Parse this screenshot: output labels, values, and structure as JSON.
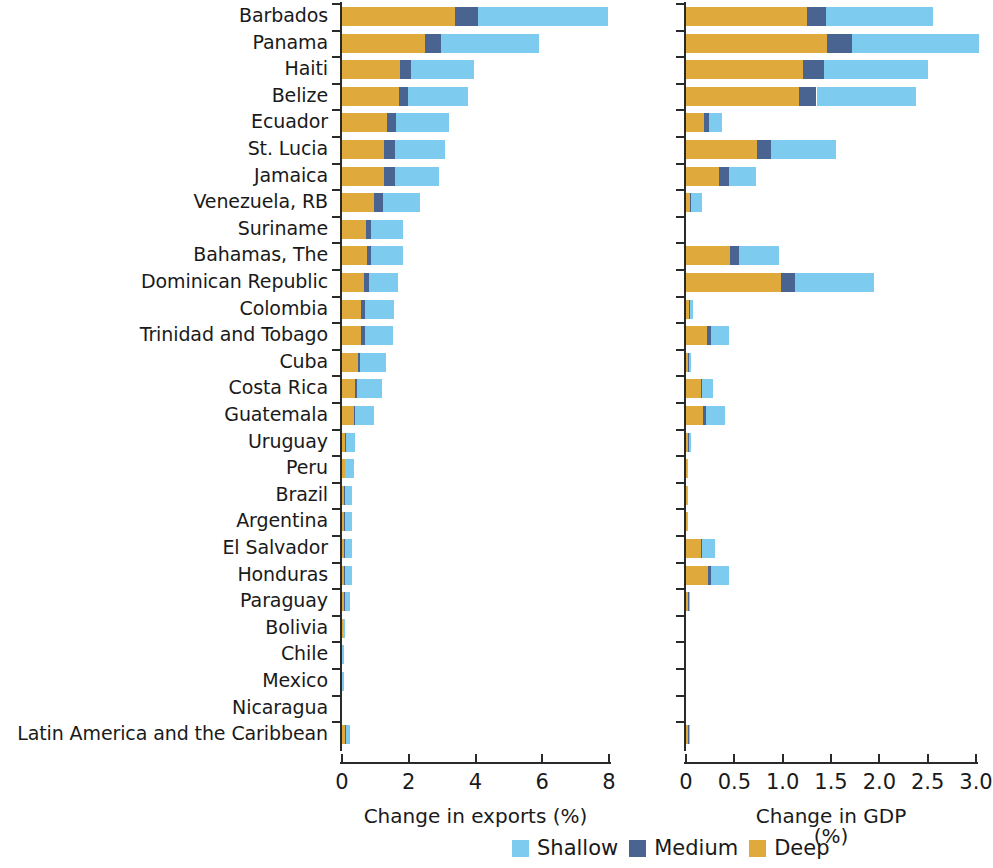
{
  "figure": {
    "legend": {
      "items": [
        {
          "label": "Shallow",
          "color": "#7dcbef",
          "key": "shallow"
        },
        {
          "label": "Medium",
          "color": "#4a6491",
          "key": "medium"
        },
        {
          "label": "Deep",
          "color": "#e0a93b",
          "key": "deep"
        }
      ]
    }
  },
  "chart_data": [
    {
      "type": "bar",
      "orientation": "horizontal",
      "stacked": true,
      "panel": "left",
      "title": "",
      "xlabel": "Change in exports (%)",
      "ylabel": "",
      "xlim": [
        0,
        8
      ],
      "xticks": [
        0,
        2,
        4,
        6,
        8
      ],
      "xticklabels": [
        "0",
        "2",
        "4",
        "6",
        "8"
      ],
      "grid": false,
      "legend_position": "bottom-right",
      "categories": [
        "Barbados",
        "Panama",
        "Haiti",
        "Belize",
        "Ecuador",
        "St. Lucia",
        "Jamaica",
        "Venezuela, RB",
        "Suriname",
        "Bahamas, The",
        "Dominican Republic",
        "Colombia",
        "Trinidad and Tobago",
        "Cuba",
        "Costa Rica",
        "Guatemala",
        "Uruguay",
        "Peru",
        "Brazil",
        "Argentina",
        "El Salvador",
        "Honduras",
        "Paraguay",
        "Bolivia",
        "Chile",
        "Mexico",
        "Nicaragua",
        "Latin America and the Caribbean"
      ],
      "series": [
        {
          "name": "Deep",
          "color": "#e0a93b",
          "values": [
            3.39,
            2.5,
            1.74,
            1.7,
            1.35,
            1.27,
            1.27,
            0.97,
            0.72,
            0.74,
            0.67,
            0.58,
            0.56,
            0.47,
            0.4,
            0.35,
            0.1,
            0.08,
            0.06,
            0.06,
            0.07,
            0.07,
            0.06,
            0.02,
            0.01,
            0.01,
            0.0,
            0.1
          ]
        },
        {
          "name": "Medium",
          "color": "#4a6491",
          "values": [
            0.68,
            0.47,
            0.33,
            0.29,
            0.27,
            0.31,
            0.31,
            0.25,
            0.15,
            0.14,
            0.13,
            0.12,
            0.12,
            0.07,
            0.06,
            0.05,
            0.03,
            0.02,
            0.02,
            0.02,
            0.02,
            0.02,
            0.02,
            0.01,
            0.0,
            0.0,
            0.0,
            0.03
          ]
        },
        {
          "name": "Shallow",
          "color": "#7dcbef",
          "values": [
            3.89,
            2.93,
            1.88,
            1.78,
            1.6,
            1.52,
            1.34,
            1.13,
            0.95,
            0.94,
            0.87,
            0.85,
            0.84,
            0.78,
            0.74,
            0.57,
            0.27,
            0.25,
            0.22,
            0.22,
            0.21,
            0.21,
            0.17,
            0.07,
            0.04,
            0.02,
            0.0,
            0.12
          ]
        }
      ],
      "totals": [
        7.96,
        5.9,
        3.95,
        3.77,
        3.22,
        3.1,
        2.92,
        2.35,
        1.82,
        1.82,
        1.67,
        1.55,
        1.52,
        1.32,
        1.2,
        0.97,
        0.4,
        0.35,
        0.3,
        0.3,
        0.3,
        0.3,
        0.25,
        0.1,
        0.05,
        0.03,
        0.0,
        0.25
      ]
    },
    {
      "type": "bar",
      "orientation": "horizontal",
      "stacked": true,
      "panel": "right",
      "title": "",
      "xlabel": "Change in GDP (%)",
      "ylabel": "",
      "xlim": [
        0,
        3.1
      ],
      "xticks": [
        0,
        0.5,
        1.0,
        1.5,
        2.0,
        2.5,
        3.0
      ],
      "xticklabels": [
        "0",
        "0.5",
        "1.0",
        "1.5",
        "2.0",
        "2.5",
        "3.0"
      ],
      "grid": false,
      "legend_position": "bottom-right",
      "categories": [
        "Barbados",
        "Panama",
        "Haiti",
        "Belize",
        "Ecuador",
        "St. Lucia",
        "Jamaica",
        "Venezuela, RB",
        "Suriname",
        "Bahamas, The",
        "Dominican Republic",
        "Colombia",
        "Trinidad and Tobago",
        "Cuba",
        "Costa Rica",
        "Guatemala",
        "Uruguay",
        "Peru",
        "Brazil",
        "Argentina",
        "El Salvador",
        "Honduras",
        "Paraguay",
        "Bolivia",
        "Chile",
        "Mexico",
        "Nicaragua",
        "Latin America and the Caribbean"
      ],
      "series": [
        {
          "name": "Deep",
          "color": "#e0a93b",
          "values": [
            1.25,
            1.46,
            1.21,
            1.17,
            0.19,
            0.73,
            0.34,
            0.04,
            0.0,
            0.46,
            0.98,
            0.03,
            0.22,
            0.02,
            0.15,
            0.18,
            0.02,
            0.01,
            0.01,
            0.01,
            0.15,
            0.23,
            0.02,
            0.0,
            0.0,
            0.0,
            0.0,
            0.02
          ]
        },
        {
          "name": "Medium",
          "color": "#4a6491",
          "values": [
            0.2,
            0.26,
            0.22,
            0.18,
            0.05,
            0.15,
            0.1,
            0.01,
            0.0,
            0.09,
            0.15,
            0.01,
            0.04,
            0.01,
            0.02,
            0.03,
            0.01,
            0.0,
            0.0,
            0.0,
            0.02,
            0.03,
            0.01,
            0.0,
            0.0,
            0.0,
            0.0,
            0.01
          ]
        },
        {
          "name": "Shallow",
          "color": "#7dcbef",
          "values": [
            1.11,
            1.31,
            1.07,
            1.03,
            0.13,
            0.67,
            0.28,
            0.12,
            0.0,
            0.41,
            0.82,
            0.03,
            0.19,
            0.02,
            0.11,
            0.19,
            0.02,
            0.01,
            0.01,
            0.01,
            0.13,
            0.18,
            0.01,
            0.0,
            0.0,
            0.0,
            0.0,
            0.01
          ]
        }
      ],
      "totals": [
        2.56,
        3.03,
        2.5,
        2.38,
        0.37,
        1.55,
        0.72,
        0.17,
        0.0,
        0.96,
        1.95,
        0.07,
        0.45,
        0.05,
        0.28,
        0.4,
        0.05,
        0.02,
        0.02,
        0.02,
        0.3,
        0.44,
        0.04,
        0.0,
        0.0,
        0.0,
        0.0,
        0.04
      ]
    }
  ]
}
